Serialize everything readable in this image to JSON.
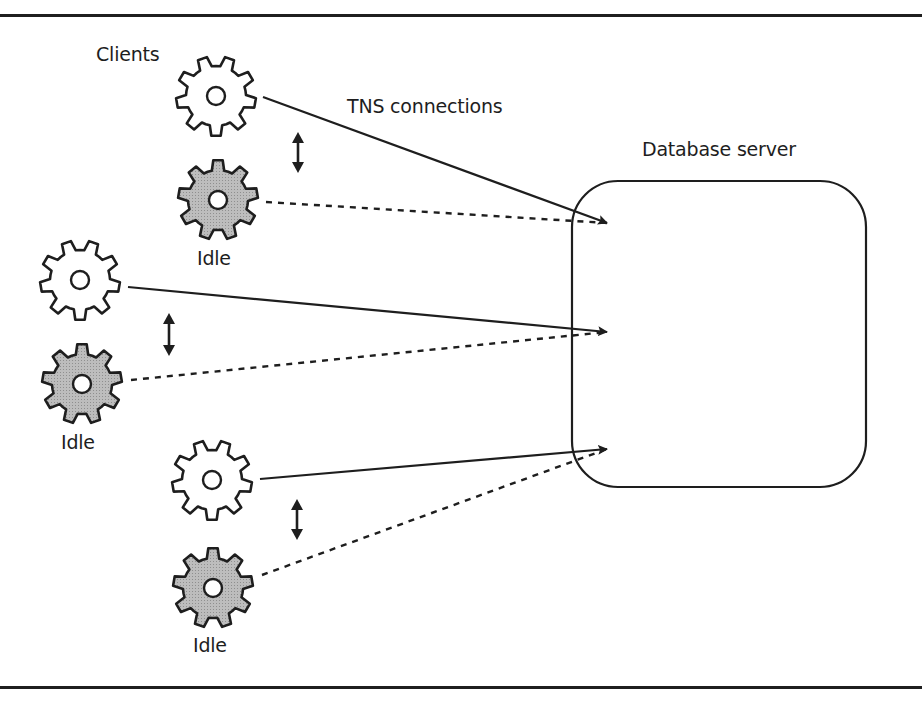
{
  "figure": {
    "width": 922,
    "height": 704,
    "rules": [
      {
        "y": 14
      },
      {
        "y": 686
      }
    ],
    "colors": {
      "stroke": "#1e1e1e",
      "active_fill": "#ffffff",
      "idle_fill": "#b4b4b4",
      "background": "#ffffff"
    }
  },
  "labels": {
    "clients": {
      "text": "Clients",
      "x": 96,
      "y": 45
    },
    "tns_connections": {
      "text": "TNS connections",
      "x": 347,
      "y": 97
    },
    "database_server": {
      "text": "Database server",
      "x": 642,
      "y": 140
    },
    "idle_1": {
      "text": "Idle",
      "x": 197,
      "y": 249
    },
    "idle_2": {
      "text": "Idle",
      "x": 61,
      "y": 433
    },
    "idle_3": {
      "text": "Idle",
      "x": 193,
      "y": 636
    }
  },
  "database_server": {
    "x": 572,
    "y": 181,
    "width": 294,
    "height": 306,
    "radius": 46
  },
  "clients": [
    {
      "id": "client-1-active",
      "state": "active",
      "cx": 216,
      "cy": 96
    },
    {
      "id": "client-1-idle",
      "state": "idle",
      "cx": 218,
      "cy": 200
    },
    {
      "id": "client-2-active",
      "state": "active",
      "cx": 80,
      "cy": 280
    },
    {
      "id": "client-2-idle",
      "state": "idle",
      "cx": 82,
      "cy": 384
    },
    {
      "id": "client-3-active",
      "state": "active",
      "cx": 212,
      "cy": 480
    },
    {
      "id": "client-3-idle",
      "state": "idle",
      "cx": 213,
      "cy": 588
    }
  ],
  "connections": [
    {
      "from": "client-1-active",
      "style": "solid",
      "x1": 263,
      "y1": 97,
      "x2": 607,
      "y2": 223
    },
    {
      "from": "client-1-idle",
      "style": "dashed",
      "x1": 266,
      "y1": 202,
      "x2": 607,
      "y2": 223
    },
    {
      "from": "client-2-active",
      "style": "solid",
      "x1": 128,
      "y1": 287,
      "x2": 607,
      "y2": 332
    },
    {
      "from": "client-2-idle",
      "style": "dashed",
      "x1": 131,
      "y1": 380,
      "x2": 607,
      "y2": 332
    },
    {
      "from": "client-3-active",
      "style": "solid",
      "x1": 260,
      "y1": 479,
      "x2": 607,
      "y2": 449
    },
    {
      "from": "client-3-idle",
      "style": "dashed",
      "x1": 262,
      "y1": 575,
      "x2": 607,
      "y2": 449
    }
  ],
  "swap_arrows": [
    {
      "x": 298,
      "y1": 132,
      "y2": 173
    },
    {
      "x": 169,
      "y1": 313,
      "y2": 356
    },
    {
      "x": 297,
      "y1": 499,
      "y2": 540
    }
  ]
}
